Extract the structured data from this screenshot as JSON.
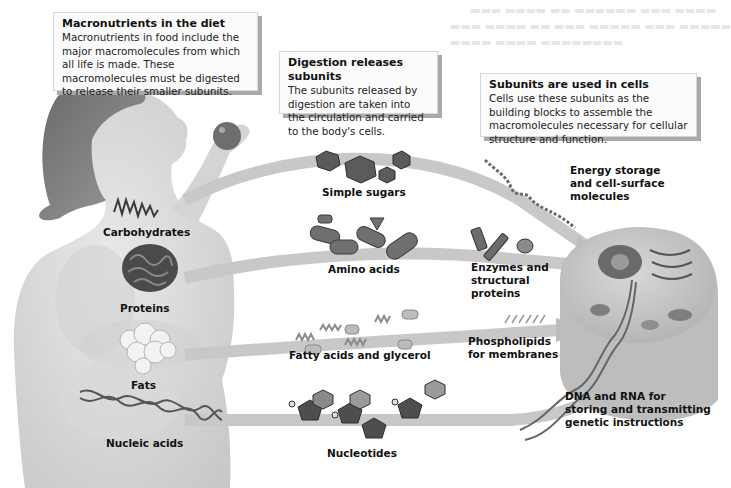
{
  "figure": {
    "style": "grayscale",
    "colors": {
      "arrow": "#c9c9c9",
      "body": "#d8d8d8",
      "callout_bg": "#fbfbfb",
      "callout_shadow": "#a9a9a9",
      "text": "#111111"
    }
  },
  "callouts": [
    {
      "title": "Macronutrients in the diet",
      "body": "Macronutrients in food include the major macromolecules from which all life is made. These macromolecules must be digested to release their smaller subunits."
    },
    {
      "title": "Digestion releases subunits",
      "body": "The subunits released by digestion are taken into the circulation and carried to the body's cells."
    },
    {
      "title": "Subunits are used in cells",
      "body": "Cells use these subunits as the building blocks to assemble the macromolecules necessary for cellular structure and function."
    }
  ],
  "macronutrients": [
    {
      "label": "Carbohydrates",
      "icon": "carbohydrate-chain-icon"
    },
    {
      "label": "Proteins",
      "icon": "protein-coil-icon"
    },
    {
      "label": "Fats",
      "icon": "fat-globules-icon"
    },
    {
      "label": "Nucleic acids",
      "icon": "dna-helix-icon"
    }
  ],
  "subunits": [
    {
      "label": "Simple sugars",
      "icon": "hexagon-sugars-icon"
    },
    {
      "label": "Amino acids",
      "icon": "amino-acid-capsules-icon"
    },
    {
      "label": "Fatty acids and glycerol",
      "icon": "fatty-acid-chains-icon"
    },
    {
      "label": "Nucleotides",
      "icon": "nucleotide-rings-icon"
    }
  ],
  "products": [
    {
      "label": "Energy storage\nand cell-surface\nmolecules"
    },
    {
      "label": "Enzymes and\nstructural\nproteins"
    },
    {
      "label": "Phospholipids\nfor membranes"
    },
    {
      "label": "DNA and RNA for\nstoring and transmitting\ngenetic instructions"
    }
  ]
}
